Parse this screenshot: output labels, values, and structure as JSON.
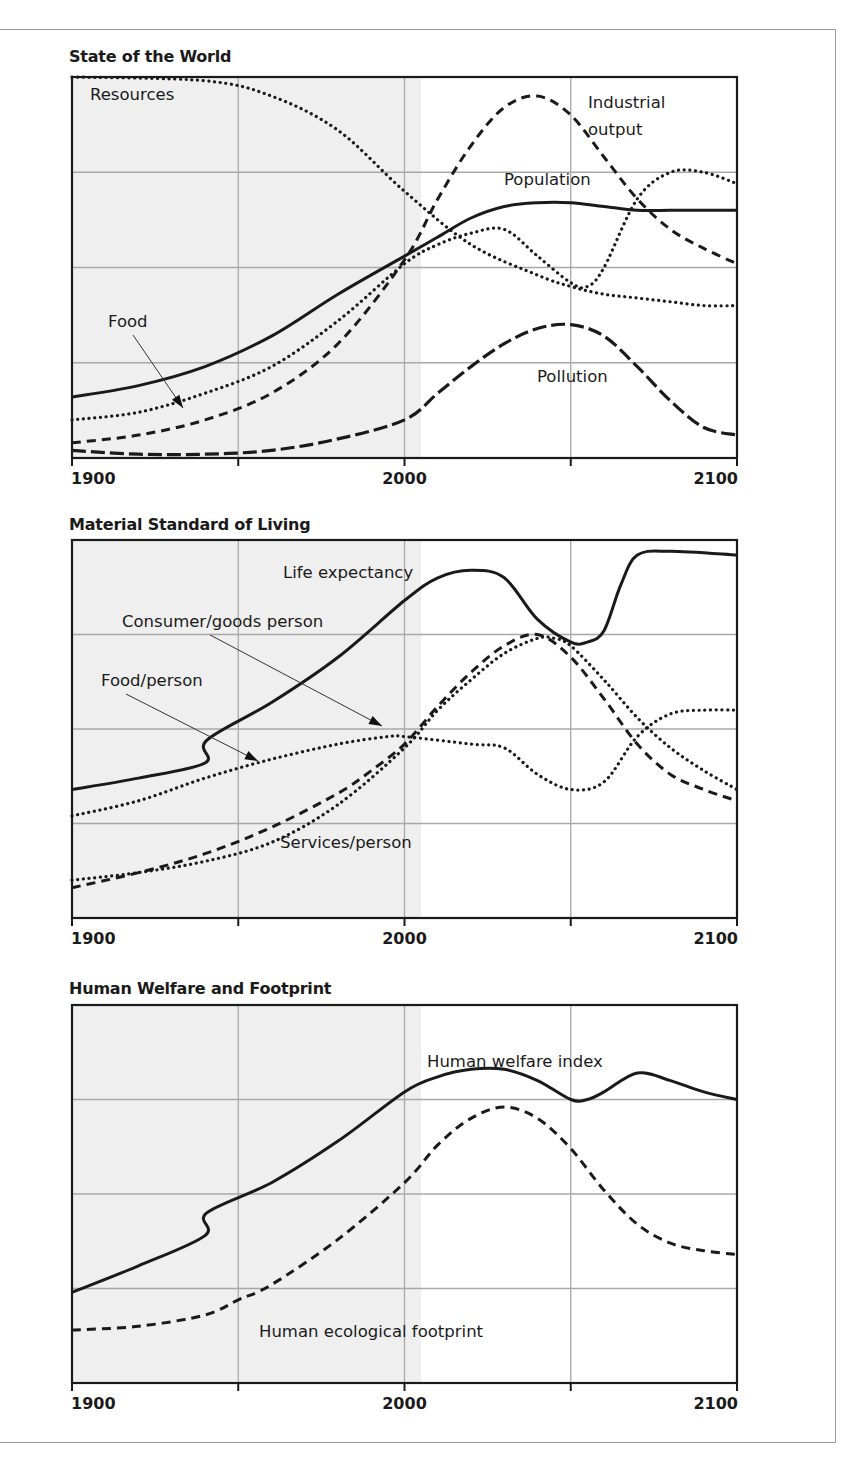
{
  "chart_data": [
    {
      "type": "line",
      "title": "State of the World",
      "xlabel": "",
      "ylabel": "",
      "x_ticks": [
        1900,
        1950,
        2000,
        2050,
        2100
      ],
      "x_tick_labels": [
        "1900",
        "",
        "2000",
        "",
        "2100"
      ],
      "xlim": [
        1900,
        2100
      ],
      "ylim": [
        0,
        1
      ],
      "grid": true,
      "shaded_region": [
        1900,
        2005
      ],
      "series": [
        {
          "name": "Resources",
          "style": "dotted",
          "x": [
            1900,
            1940,
            1960,
            1980,
            2000,
            2020,
            2040,
            2050,
            2060,
            2070,
            2080,
            2090,
            2100
          ],
          "values": [
            1.0,
            0.99,
            0.95,
            0.86,
            0.7,
            0.56,
            0.48,
            0.45,
            0.43,
            0.42,
            0.41,
            0.4,
            0.4
          ]
        },
        {
          "name": "Industrial output",
          "style": "dashed",
          "x": [
            1900,
            1920,
            1940,
            1960,
            1980,
            2000,
            2010,
            2020,
            2030,
            2040,
            2050,
            2060,
            2070,
            2080,
            2090,
            2100
          ],
          "values": [
            0.04,
            0.06,
            0.1,
            0.17,
            0.3,
            0.52,
            0.68,
            0.82,
            0.92,
            0.95,
            0.9,
            0.79,
            0.68,
            0.6,
            0.55,
            0.51
          ]
        },
        {
          "name": "Population",
          "style": "solid",
          "x": [
            1900,
            1920,
            1940,
            1960,
            1980,
            2000,
            2010,
            2020,
            2030,
            2040,
            2050,
            2060,
            2070,
            2080,
            2090,
            2100
          ],
          "values": [
            0.16,
            0.19,
            0.24,
            0.32,
            0.43,
            0.53,
            0.58,
            0.63,
            0.66,
            0.67,
            0.67,
            0.66,
            0.65,
            0.65,
            0.65,
            0.65
          ]
        },
        {
          "name": "Food",
          "style": "dotted",
          "x": [
            1900,
            1920,
            1940,
            1960,
            1980,
            2000,
            2010,
            2020,
            2030,
            2040,
            2050,
            2055,
            2060,
            2070,
            2080,
            2090,
            2100
          ],
          "values": [
            0.1,
            0.12,
            0.17,
            0.24,
            0.36,
            0.51,
            0.56,
            0.59,
            0.6,
            0.53,
            0.46,
            0.45,
            0.5,
            0.68,
            0.75,
            0.75,
            0.72
          ]
        },
        {
          "name": "Pollution",
          "style": "long-dashed",
          "x": [
            1900,
            1920,
            1940,
            1960,
            1980,
            2000,
            2010,
            2020,
            2030,
            2040,
            2050,
            2060,
            2070,
            2080,
            2090,
            2100
          ],
          "values": [
            0.02,
            0.01,
            0.01,
            0.02,
            0.05,
            0.1,
            0.17,
            0.24,
            0.3,
            0.34,
            0.35,
            0.32,
            0.24,
            0.15,
            0.08,
            0.06
          ]
        }
      ],
      "annotations": [
        {
          "text": "Resources",
          "x_px": 90,
          "y_px": 100
        },
        {
          "text": "Industrial output",
          "lines": [
            "Industrial",
            "output"
          ],
          "x_px": 588,
          "y_px": 108
        },
        {
          "text": "Population",
          "x_px": 504,
          "y_px": 185
        },
        {
          "text": "Food",
          "x_px": 108,
          "y_px": 327,
          "arrow_to": [
            183,
            408
          ]
        },
        {
          "text": "Pollution",
          "x_px": 537,
          "y_px": 382
        }
      ]
    },
    {
      "type": "line",
      "title": "Material Standard of Living",
      "xlabel": "",
      "ylabel": "",
      "x_ticks": [
        1900,
        1950,
        2000,
        2050,
        2100
      ],
      "x_tick_labels": [
        "1900",
        "",
        "2000",
        "",
        "2100"
      ],
      "xlim": [
        1900,
        2100
      ],
      "ylim": [
        0,
        1
      ],
      "grid": true,
      "shaded_region": [
        1900,
        2005
      ],
      "series": [
        {
          "name": "Life expectancy",
          "style": "solid",
          "x": [
            1900,
            1920,
            1940,
            1940.5,
            1960,
            1980,
            2000,
            2010,
            2020,
            2030,
            2040,
            2050,
            2055,
            2060,
            2065,
            2070,
            2080,
            2100
          ],
          "values": [
            0.34,
            0.37,
            0.41,
            0.47,
            0.57,
            0.69,
            0.84,
            0.9,
            0.92,
            0.9,
            0.79,
            0.73,
            0.73,
            0.76,
            0.88,
            0.96,
            0.97,
            0.96
          ]
        },
        {
          "name": "Consumer/goods person",
          "style": "dashed",
          "x": [
            1900,
            1920,
            1940,
            1960,
            1980,
            1990,
            2000,
            2010,
            2020,
            2030,
            2040,
            2050,
            2060,
            2070,
            2080,
            2090,
            2100
          ],
          "values": [
            0.08,
            0.12,
            0.17,
            0.24,
            0.33,
            0.39,
            0.46,
            0.56,
            0.65,
            0.72,
            0.75,
            0.69,
            0.58,
            0.46,
            0.38,
            0.34,
            0.31
          ]
        },
        {
          "name": "Food/person",
          "style": "dotted",
          "x": [
            1900,
            1920,
            1940,
            1960,
            1980,
            1995,
            2000,
            2020,
            2030,
            2040,
            2050,
            2060,
            2070,
            2080,
            2090,
            2100
          ],
          "values": [
            0.27,
            0.31,
            0.37,
            0.42,
            0.46,
            0.48,
            0.48,
            0.46,
            0.45,
            0.38,
            0.34,
            0.36,
            0.48,
            0.54,
            0.55,
            0.55
          ]
        },
        {
          "name": "Services/person",
          "style": "dotted",
          "x": [
            1900,
            1920,
            1940,
            1960,
            1980,
            2000,
            2010,
            2020,
            2030,
            2040,
            2045,
            2050,
            2060,
            2070,
            2080,
            2090,
            2100
          ],
          "values": [
            0.1,
            0.12,
            0.15,
            0.2,
            0.3,
            0.45,
            0.55,
            0.63,
            0.7,
            0.74,
            0.74,
            0.72,
            0.63,
            0.53,
            0.45,
            0.39,
            0.34
          ]
        }
      ],
      "annotations": [
        {
          "text": "Life expectancy",
          "x_px": 283,
          "y_px": 578
        },
        {
          "text": "Consumer/goods person",
          "x_px": 122,
          "y_px": 627,
          "arrow_to": [
            382,
            726
          ]
        },
        {
          "text": "Food/person",
          "x_px": 101,
          "y_px": 686,
          "arrow_to": [
            258,
            761
          ]
        },
        {
          "text": "Services/person",
          "x_px": 280,
          "y_px": 848
        }
      ]
    },
    {
      "type": "line",
      "title": "Human Welfare and Footprint",
      "xlabel": "",
      "ylabel": "",
      "x_ticks": [
        1900,
        1950,
        2000,
        2050,
        2100
      ],
      "x_tick_labels": [
        "1900",
        "",
        "2000",
        "",
        "2100"
      ],
      "xlim": [
        1900,
        2100
      ],
      "ylim": [
        0,
        1
      ],
      "grid": true,
      "shaded_region": [
        1900,
        2005
      ],
      "series": [
        {
          "name": "Human welfare index",
          "style": "solid",
          "x": [
            1900,
            1920,
            1940,
            1940.5,
            1960,
            1980,
            2000,
            2010,
            2020,
            2030,
            2040,
            2050,
            2055,
            2060,
            2070,
            2080,
            2090,
            2100
          ],
          "values": [
            0.24,
            0.31,
            0.39,
            0.45,
            0.53,
            0.64,
            0.77,
            0.81,
            0.83,
            0.83,
            0.8,
            0.75,
            0.75,
            0.77,
            0.82,
            0.8,
            0.77,
            0.75
          ]
        },
        {
          "name": "Human ecological footprint",
          "style": "dashed",
          "x": [
            1900,
            1920,
            1940,
            1950,
            1960,
            1980,
            2000,
            2010,
            2020,
            2030,
            2040,
            2050,
            2060,
            2070,
            2080,
            2090,
            2100
          ],
          "values": [
            0.14,
            0.15,
            0.18,
            0.22,
            0.26,
            0.38,
            0.53,
            0.63,
            0.7,
            0.73,
            0.7,
            0.62,
            0.51,
            0.42,
            0.37,
            0.35,
            0.34
          ]
        }
      ],
      "annotations": [
        {
          "text": "Human welfare index",
          "x_px": 427,
          "y_px": 1067
        },
        {
          "text": "Human ecological footprint",
          "x_px": 259,
          "y_px": 1337
        }
      ]
    }
  ],
  "panels": [
    {
      "title": "State of the World"
    },
    {
      "title": "Material Standard of Living"
    },
    {
      "title": "Human Welfare and Footprint"
    }
  ],
  "colors": {
    "line": "#1a1a1a",
    "grid": "#a8a8a8",
    "shade": "#efefef",
    "frame": "#9a9a9a"
  }
}
